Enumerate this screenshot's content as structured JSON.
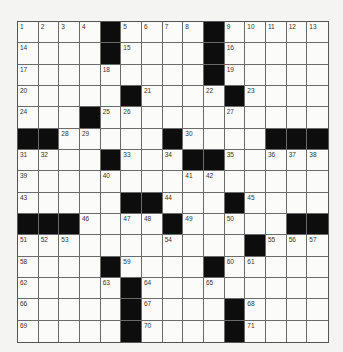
{
  "puzzle": {
    "rows": 15,
    "cols": 15,
    "colors": {
      "black": "#0d0d0d",
      "white": "#fbfbf9",
      "line": "#6a6a6a"
    },
    "grid": [
      [
        "1",
        "2",
        "3",
        "4",
        "#",
        "5",
        "6",
        "7",
        "8",
        "#",
        "9",
        "10",
        "11",
        "12",
        "13"
      ],
      [
        "14",
        ".",
        ".",
        ".",
        "#",
        "15",
        ".",
        ".",
        ".",
        "#",
        "16",
        ".",
        ".",
        ".",
        "."
      ],
      [
        "17",
        ".",
        ".",
        ".",
        "18",
        ".",
        ".",
        ".",
        ".",
        "#",
        "19",
        ".",
        ".",
        ".",
        "."
      ],
      [
        "20",
        ".",
        ".",
        ".",
        ".",
        "#",
        "21",
        ".",
        ".",
        "22",
        "#",
        "23",
        ".",
        ".",
        "."
      ],
      [
        "24",
        ".",
        ".",
        "#",
        "25",
        "26",
        ".",
        ".",
        ".",
        ".",
        "27",
        ".",
        ".",
        ".",
        "."
      ],
      [
        "#",
        "#",
        "28",
        "29",
        ".",
        ".",
        ".",
        "#",
        "30",
        ".",
        ".",
        ".",
        "#",
        "#",
        "#"
      ],
      [
        "31",
        "32",
        ".",
        ".",
        "#",
        "33",
        ".",
        "34",
        "#",
        "#",
        "35",
        ".",
        "36",
        "37",
        "38"
      ],
      [
        "39",
        ".",
        ".",
        ".",
        "40",
        ".",
        ".",
        ".",
        "41",
        "42",
        ".",
        ".",
        ".",
        ".",
        "."
      ],
      [
        "43",
        ".",
        ".",
        ".",
        ".",
        "#",
        "#",
        "44",
        ".",
        ".",
        "#",
        "45",
        ".",
        ".",
        "."
      ],
      [
        "#",
        "#",
        "#",
        "46",
        ".",
        "47",
        "48",
        "#",
        "49",
        ".",
        "50",
        ".",
        ".",
        "#",
        "#"
      ],
      [
        "51",
        "52",
        "53",
        ".",
        ".",
        ".",
        ".",
        "54",
        ".",
        ".",
        ".",
        "#",
        "55",
        "56",
        "57"
      ],
      [
        "58",
        ".",
        ".",
        ".",
        "#",
        "59",
        ".",
        ".",
        ".",
        "#",
        "60",
        "61",
        ".",
        ".",
        "."
      ],
      [
        "62",
        ".",
        ".",
        ".",
        "63",
        "#",
        "64",
        ".",
        ".",
        "65",
        ".",
        ".",
        ".",
        ".",
        "."
      ],
      [
        "66",
        ".",
        ".",
        ".",
        ".",
        "#",
        "67",
        ".",
        ".",
        ".",
        "#",
        "68",
        ".",
        ".",
        "."
      ],
      [
        "69",
        ".",
        ".",
        ".",
        ".",
        "#",
        "70",
        ".",
        ".",
        ".",
        "#",
        "71",
        ".",
        ".",
        "."
      ]
    ]
  }
}
